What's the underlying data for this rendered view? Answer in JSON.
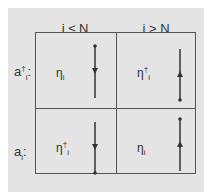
{
  "columns": [
    {
      "label": "i ≤ N"
    },
    {
      "label": "i > N"
    }
  ],
  "rows": [
    {
      "label_base": "a",
      "label_sup": "†",
      "label_sub": "i",
      "label_suffix": ":",
      "cells": [
        {
          "symbol_base": "η",
          "symbol_sup": "",
          "symbol_sub": "i",
          "arrow": "down"
        },
        {
          "symbol_base": "η",
          "symbol_sup": "†",
          "symbol_sub": "i",
          "arrow": "up"
        }
      ]
    },
    {
      "label_base": "a",
      "label_sup": "",
      "label_sub": "i",
      "label_suffix": ":",
      "cells": [
        {
          "symbol_base": "η",
          "symbol_sup": "†",
          "symbol_sub": "i",
          "arrow": "down"
        },
        {
          "symbol_base": "η",
          "symbol_sup": "",
          "symbol_sub": "i",
          "arrow": "up"
        }
      ]
    }
  ],
  "colors": {
    "background": "#e4e4e4",
    "lines": "#555555",
    "arrows": "#333333"
  }
}
